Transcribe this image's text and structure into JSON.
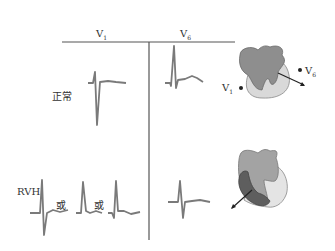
{
  "header": {
    "col_v1": "V",
    "col_v1_sub": "1",
    "col_v6": "V",
    "col_v6_sub": "6"
  },
  "rows": [
    {
      "label": "正常"
    },
    {
      "label": "RVH",
      "or_label_1": "或",
      "or_label_2": "或"
    }
  ],
  "heart_normal": {
    "lead_v1": "V",
    "lead_v1_sub": "1",
    "lead_v6": "V",
    "lead_v6_sub": "6"
  },
  "colors": {
    "trace": "#7a7a7a",
    "grid_line": "#555555",
    "heart_dark": "#8e8e8e",
    "heart_light": "#d9d9d9",
    "rv_hypertrophy": "#5e5e5e"
  }
}
